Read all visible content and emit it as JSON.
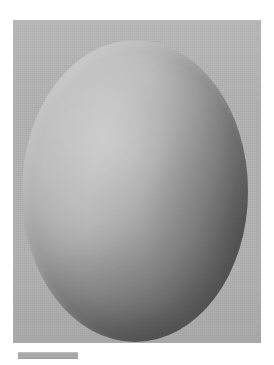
{
  "figure": {
    "kind": "shaded-ellipsoid-render",
    "canvas": {
      "width_px": 274,
      "height_px": 365,
      "background_color": "#ffffff"
    },
    "render_panel": {
      "label": "",
      "left_px": 13,
      "top_px": 20,
      "width_px": 248,
      "height_px": 323,
      "background_color": "#b1b1b1"
    },
    "object": {
      "label": "",
      "shape": "ellipsoid",
      "center_x_px": 135,
      "center_y_px": 191,
      "radius_x_px": 113,
      "radius_y_px": 151,
      "highlight_color": "#cfcfcf",
      "midtone_color": "#b0b0b0",
      "terminator_color": "#8b8b8b",
      "shadow_color": "#6a6a6a",
      "light_direction": "upper-left",
      "highlight_center_pct": {
        "x": 34,
        "y": 30
      }
    },
    "caption_bar": {
      "label": "",
      "left_px": 18,
      "top_px": 352,
      "width_px": 60,
      "height_px": 5,
      "color": "#a9a9a9"
    }
  }
}
